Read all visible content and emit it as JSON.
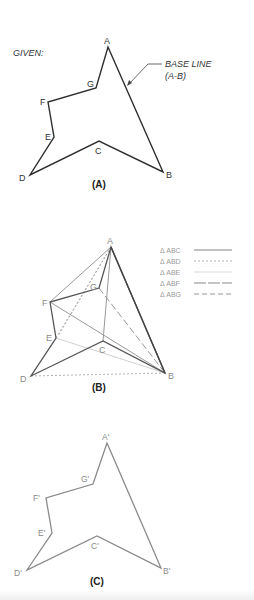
{
  "figure": {
    "panels": [
      {
        "id": "A",
        "caption": "(A)",
        "given_label": "GIVEN:",
        "base_line_label_1": "BASE LINE",
        "base_line_label_2": "(A-B)",
        "vertices": {
          "A": {
            "label": "A",
            "x": 108,
            "y": 47
          },
          "B": {
            "label": "B",
            "x": 163,
            "y": 172
          },
          "C": {
            "label": "C",
            "x": 99,
            "y": 141
          },
          "D": {
            "label": "D",
            "x": 30,
            "y": 175
          },
          "E": {
            "label": "E",
            "x": 54,
            "y": 137
          },
          "F": {
            "label": "F",
            "x": 48,
            "y": 102
          },
          "G": {
            "label": "G",
            "x": 96,
            "y": 88
          }
        }
      },
      {
        "id": "B",
        "caption": "(B)",
        "vertices": {
          "A": {
            "label": "A",
            "x": 111,
            "y": 247
          },
          "B": {
            "label": "B",
            "x": 165,
            "y": 373
          },
          "C": {
            "label": "C",
            "x": 103,
            "y": 341
          },
          "D": {
            "label": "D",
            "x": 31,
            "y": 376
          },
          "E": {
            "label": "E",
            "x": 56,
            "y": 338
          },
          "F": {
            "label": "F",
            "x": 50,
            "y": 302
          },
          "G": {
            "label": "G",
            "x": 99,
            "y": 288
          }
        },
        "legend": [
          {
            "label": "Δ ABC",
            "style": "solid-dark"
          },
          {
            "label": "Δ ABD",
            "style": "dotted"
          },
          {
            "label": "Δ ABE",
            "style": "solid-light"
          },
          {
            "label": "Δ ABF",
            "style": "long-dash"
          },
          {
            "label": "Δ ABG",
            "style": "dashed"
          }
        ]
      },
      {
        "id": "C",
        "caption": "(C)",
        "vertices": {
          "A": {
            "label": "A'",
            "x": 107,
            "y": 443
          },
          "B": {
            "label": "B'",
            "x": 161,
            "y": 568
          },
          "C": {
            "label": "C'",
            "x": 97,
            "y": 536
          },
          "D": {
            "label": "D'",
            "x": 27,
            "y": 570
          },
          "E": {
            "label": "E'",
            "x": 52,
            "y": 533
          },
          "F": {
            "label": "F'",
            "x": 46,
            "y": 498
          },
          "G": {
            "label": "G'",
            "x": 93,
            "y": 484
          }
        }
      }
    ],
    "colors": {
      "outline_dark": "#333333",
      "construction_gray": "#8c8c8c",
      "light_gray": "#bdbdbd",
      "transferred_outline": "#8a8a8a"
    }
  }
}
